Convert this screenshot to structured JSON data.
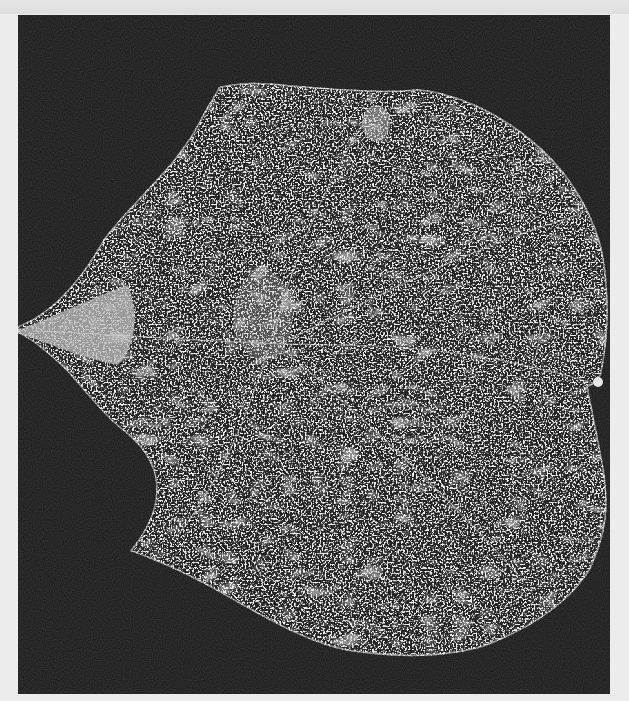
{
  "image": {
    "subject": "Leaf specimen photographed on black background",
    "description": "Heart-shaped leaf with speckled white/grey venation texture, pointed tip at left, two rounded lobes at right",
    "colors": {
      "background_page": "#ececec",
      "frame": "#161616",
      "leaf_base": "#2a2a2a",
      "speckle": "#d8d8d8",
      "tip_highlight": "#bdbdbd"
    },
    "frame": {
      "x": 18,
      "y": 15,
      "width": 592,
      "height": 679
    }
  }
}
